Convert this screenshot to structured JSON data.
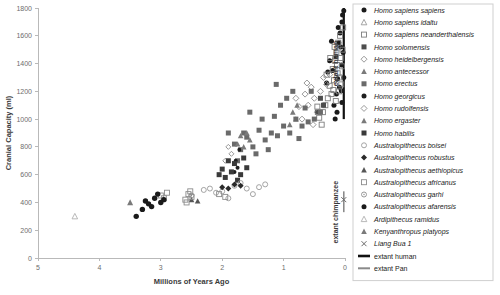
{
  "chart_data": {
    "type": "scatter",
    "title": "",
    "xlabel": "Millions of Years Ago",
    "ylabel": "Cranial Capacity (ml)",
    "xlim": [
      5,
      0
    ],
    "ylim": [
      0,
      1800
    ],
    "x_reversed": true,
    "xticks": [
      5,
      4,
      3,
      2,
      1,
      0
    ],
    "yticks": [
      0,
      200,
      400,
      600,
      800,
      1000,
      1200,
      1400,
      1600,
      1800
    ],
    "grid": false,
    "legend_position": "right",
    "annotations": [
      {
        "name": "extant-human-label",
        "text": "extant human",
        "x": 0.12,
        "y": 1400,
        "rotation": -90
      },
      {
        "name": "extant-chimpanzee-label",
        "text": "extant chimpanzee",
        "x": 0.12,
        "y": 330,
        "rotation": -90
      }
    ],
    "reference_bars": [
      {
        "name": "extant human",
        "x": 0.02,
        "y_min": 1000,
        "y_max": 1800,
        "color": "#111111",
        "width": 2.2
      },
      {
        "name": "extant Pan",
        "x": 0.02,
        "y_min": 330,
        "y_max": 480,
        "color": "#8a8a8a",
        "width": 1.6
      }
    ],
    "series": [
      {
        "name": "Homo sapiens sapiens",
        "marker": "filled-circle",
        "color": "#1a1a1a",
        "points": [
          [
            0.2,
            1350
          ],
          [
            0.15,
            1450
          ],
          [
            0.1,
            1550
          ],
          [
            0.08,
            1620
          ],
          [
            0.05,
            1700
          ],
          [
            0.04,
            1750
          ],
          [
            0.03,
            1480
          ],
          [
            0.06,
            1390
          ],
          [
            0.12,
            1290
          ],
          [
            0.09,
            1230
          ],
          [
            0.07,
            1520
          ],
          [
            0.11,
            1660
          ],
          [
            0.14,
            1180
          ],
          [
            0.18,
            1100
          ],
          [
            0.25,
            1420
          ],
          [
            0.3,
            1260
          ],
          [
            0.02,
            1780
          ],
          [
            0.02,
            1300
          ],
          [
            0.05,
            1120
          ],
          [
            0.16,
            1000
          ],
          [
            0.22,
            1560
          ],
          [
            0.28,
            1340
          ],
          [
            0.13,
            1050
          ],
          [
            0.06,
            1205
          ]
        ]
      },
      {
        "name": "Homo sapiens idaltu",
        "marker": "open-triangle",
        "color": "#9a9a9a",
        "points": [
          [
            0.16,
            1450
          ]
        ]
      },
      {
        "name": "Homo sapiens neanderthalensis",
        "marker": "open-square",
        "color": "#7d7d7d",
        "points": [
          [
            0.04,
            1500
          ],
          [
            0.05,
            1380
          ],
          [
            0.07,
            1440
          ],
          [
            0.09,
            1300
          ],
          [
            0.11,
            1550
          ],
          [
            0.13,
            1390
          ],
          [
            0.06,
            1250
          ],
          [
            0.08,
            1600
          ],
          [
            0.1,
            1200
          ],
          [
            0.14,
            1480
          ],
          [
            0.12,
            1330
          ],
          [
            0.16,
            1420
          ],
          [
            0.18,
            1280
          ],
          [
            0.2,
            1360
          ],
          [
            0.22,
            1180
          ],
          [
            0.25,
            1240
          ],
          [
            0.28,
            1150
          ],
          [
            0.32,
            1100
          ],
          [
            0.36,
            1050
          ],
          [
            0.42,
            1010
          ],
          [
            0.17,
            1520
          ],
          [
            0.03,
            1660
          ],
          [
            0.15,
            1130
          ],
          [
            0.24,
            1440
          ],
          [
            0.3,
            1320
          ],
          [
            0.38,
            960
          ],
          [
            0.45,
            1090
          ],
          [
            0.19,
            1210
          ]
        ]
      },
      {
        "name": "Homo solomensis",
        "marker": "filled-square",
        "color": "#4d4d4d",
        "points": [
          [
            0.35,
            1100
          ],
          [
            0.4,
            1150
          ],
          [
            0.45,
            1050
          ]
        ]
      },
      {
        "name": "Homo heidelbergensis",
        "marker": "open-diamond",
        "color": "#8c8c8c",
        "points": [
          [
            0.3,
            1250
          ],
          [
            0.4,
            1200
          ],
          [
            0.5,
            1150
          ],
          [
            0.6,
            1100
          ],
          [
            0.35,
            1300
          ],
          [
            0.45,
            1050
          ],
          [
            0.55,
            1230
          ],
          [
            0.65,
            1180
          ],
          [
            0.7,
            1000
          ],
          [
            0.25,
            1320
          ],
          [
            0.75,
            1090
          ],
          [
            0.8,
            1150
          ],
          [
            0.52,
            960
          ],
          [
            0.62,
            1260
          ]
        ]
      },
      {
        "name": "Homo antecessor",
        "marker": "filled-triangle",
        "color": "#7a7a7a",
        "points": [
          [
            0.8,
            1000
          ],
          [
            0.85,
            1050
          ],
          [
            0.9,
            960
          ],
          [
            0.78,
            1100
          ]
        ]
      },
      {
        "name": "Homo erectus",
        "marker": "filled-square-gray",
        "color": "#6a6a6a",
        "points": [
          [
            0.4,
            1050
          ],
          [
            0.5,
            1000
          ],
          [
            0.6,
            980
          ],
          [
            0.7,
            950
          ],
          [
            0.8,
            1000
          ],
          [
            0.9,
            900
          ],
          [
            1.0,
            950
          ],
          [
            1.1,
            880
          ],
          [
            1.2,
            900
          ],
          [
            1.3,
            850
          ],
          [
            1.4,
            920
          ],
          [
            1.5,
            800
          ],
          [
            1.6,
            870
          ],
          [
            1.7,
            780
          ],
          [
            1.8,
            820
          ],
          [
            0.95,
            1150
          ],
          [
            1.05,
            1100
          ],
          [
            1.15,
            1020
          ],
          [
            1.25,
            780
          ],
          [
            1.35,
            1000
          ],
          [
            1.45,
            750
          ],
          [
            1.55,
            1050
          ],
          [
            1.65,
            900
          ],
          [
            0.55,
            1200
          ],
          [
            0.65,
            1080
          ],
          [
            0.75,
            860
          ],
          [
            0.85,
            1200
          ],
          [
            1.75,
            700
          ],
          [
            1.9,
            900
          ],
          [
            1.12,
            1250
          ]
        ]
      },
      {
        "name": "Homo georgicus",
        "marker": "filled-circle-sm",
        "color": "#1f1f1f",
        "points": [
          [
            1.75,
            650
          ],
          [
            1.78,
            700
          ],
          [
            1.8,
            620
          ],
          [
            1.72,
            780
          ]
        ]
      },
      {
        "name": "Homo rudolfensis",
        "marker": "open-diamond-sm",
        "color": "#8c8c8c",
        "points": [
          [
            1.85,
            750
          ],
          [
            1.9,
            800
          ],
          [
            1.95,
            700
          ]
        ]
      },
      {
        "name": "Homo ergaster",
        "marker": "filled-triangle-gray",
        "color": "#7a7a7a",
        "points": [
          [
            1.55,
            850
          ],
          [
            1.6,
            900
          ],
          [
            1.65,
            800
          ],
          [
            1.7,
            880
          ],
          [
            1.75,
            820
          ]
        ]
      },
      {
        "name": "Homo habilis",
        "marker": "filled-square-dk",
        "color": "#3a3a3a",
        "points": [
          [
            1.6,
            650
          ],
          [
            1.7,
            600
          ],
          [
            1.8,
            680
          ],
          [
            1.85,
            620
          ],
          [
            1.9,
            700
          ],
          [
            1.95,
            580
          ],
          [
            2.0,
            640
          ],
          [
            1.65,
            720
          ],
          [
            1.75,
            560
          ],
          [
            2.05,
            600
          ]
        ]
      },
      {
        "name": "Australopithecus boisei",
        "marker": "open-circle",
        "color": "#9a9a9a",
        "points": [
          [
            1.4,
            510
          ],
          [
            1.6,
            500
          ],
          [
            1.8,
            520
          ],
          [
            2.0,
            480
          ],
          [
            2.2,
            500
          ],
          [
            1.5,
            460
          ],
          [
            1.7,
            540
          ],
          [
            1.9,
            430
          ],
          [
            2.1,
            470
          ],
          [
            1.3,
            530
          ],
          [
            2.3,
            490
          ]
        ]
      },
      {
        "name": "Australopithecus robustus",
        "marker": "filled-diamond",
        "color": "#2a2a2a",
        "points": [
          [
            1.7,
            520
          ],
          [
            1.8,
            530
          ],
          [
            1.9,
            500
          ],
          [
            2.0,
            510
          ]
        ]
      },
      {
        "name": "Australopithecus aethiopicus",
        "marker": "filled-triangle-dk",
        "color": "#555555",
        "points": [
          [
            2.4,
            410
          ],
          [
            2.5,
            420
          ]
        ]
      },
      {
        "name": "Australopithecus africanus",
        "marker": "open-square-lt",
        "color": "#8c8c8c",
        "points": [
          [
            2.5,
            440
          ],
          [
            2.55,
            460
          ],
          [
            2.6,
            420
          ],
          [
            2.58,
            400
          ],
          [
            2.52,
            480
          ],
          [
            3.0,
            450
          ],
          [
            2.95,
            430
          ],
          [
            2.9,
            470
          ],
          [
            2.05,
            460
          ],
          [
            1.95,
            440
          ]
        ]
      },
      {
        "name": "Australopithecus garhi",
        "marker": "open-circle-dot",
        "color": "#8c8c8c",
        "points": [
          [
            2.5,
            450
          ]
        ]
      },
      {
        "name": "Australopithecus afarensis",
        "marker": "filled-circle-md",
        "color": "#1a1a1a",
        "points": [
          [
            3.0,
            400
          ],
          [
            3.1,
            430
          ],
          [
            3.2,
            390
          ],
          [
            3.05,
            460
          ],
          [
            3.15,
            370
          ],
          [
            3.25,
            410
          ],
          [
            2.95,
            420
          ],
          [
            3.3,
            350
          ],
          [
            3.4,
            300
          ]
        ]
      },
      {
        "name": "Ardipithecus ramidus",
        "marker": "open-triangle-lt",
        "color": "#b0b0b0",
        "points": [
          [
            4.4,
            300
          ]
        ]
      },
      {
        "name": "Kenyanthropus platyops",
        "marker": "filled-triangle-md",
        "color": "#7a7a7a",
        "points": [
          [
            3.5,
            400
          ]
        ]
      },
      {
        "name": "Liang Bua 1",
        "marker": "x-cross",
        "color": "#6a6a6a",
        "points": [
          [
            0.02,
            420
          ]
        ]
      }
    ]
  },
  "legend": {
    "items": [
      {
        "label": "Homo sapiens sapiens",
        "marker": "filled-circle",
        "color": "#1a1a1a",
        "style": "italic"
      },
      {
        "label": "Homo sapiens idaltu",
        "marker": "open-triangle",
        "color": "#9a9a9a",
        "style": "italic"
      },
      {
        "label": "Homo sapiens neanderthalensis",
        "marker": "open-square",
        "color": "#7d7d7d",
        "style": "italic"
      },
      {
        "label": "Homo solomensis",
        "marker": "filled-square",
        "color": "#4d4d4d",
        "style": "italic"
      },
      {
        "label": "Homo heidelbergensis",
        "marker": "open-diamond",
        "color": "#8c8c8c",
        "style": "italic"
      },
      {
        "label": "Homo antecessor",
        "marker": "filled-triangle",
        "color": "#7a7a7a",
        "style": "italic"
      },
      {
        "label": "Homo erectus",
        "marker": "filled-square-gray",
        "color": "#6a6a6a",
        "style": "italic"
      },
      {
        "label": "Homo georgicus",
        "marker": "filled-circle-sm",
        "color": "#1f1f1f",
        "style": "italic"
      },
      {
        "label": "Homo rudolfensis",
        "marker": "open-diamond-sm",
        "color": "#8c8c8c",
        "style": "italic"
      },
      {
        "label": "Homo ergaster",
        "marker": "filled-triangle-gray",
        "color": "#7a7a7a",
        "style": "italic"
      },
      {
        "label": "Homo habilis",
        "marker": "filled-square-dk",
        "color": "#3a3a3a",
        "style": "italic"
      },
      {
        "label": "Australopithecus boisei",
        "marker": "open-circle",
        "color": "#9a9a9a",
        "style": "italic"
      },
      {
        "label": "Australopithecus robustus",
        "marker": "filled-diamond",
        "color": "#2a2a2a",
        "style": "italic"
      },
      {
        "label": "Australopithecus aethiopicus",
        "marker": "filled-triangle-dk",
        "color": "#555555",
        "style": "italic"
      },
      {
        "label": "Australopithecus africanus",
        "marker": "open-square-lt",
        "color": "#8c8c8c",
        "style": "italic"
      },
      {
        "label": "Australopithecus garhi",
        "marker": "open-circle-dot",
        "color": "#8c8c8c",
        "style": "italic"
      },
      {
        "label": "Australopithecus afarensis",
        "marker": "filled-circle-md",
        "color": "#1a1a1a",
        "style": "italic"
      },
      {
        "label": "Ardipithecus ramidus",
        "marker": "open-triangle-lt",
        "color": "#b0b0b0",
        "style": "italic"
      },
      {
        "label": "Kenyanthropus platyops",
        "marker": "filled-triangle-md",
        "color": "#7a7a7a",
        "style": "italic"
      },
      {
        "label": "Liang Bua 1",
        "marker": "x-cross",
        "color": "#6a6a6a",
        "style": "italic"
      },
      {
        "label": "extant human",
        "marker": "thick-line-black",
        "color": "#111111",
        "style": "plain"
      },
      {
        "label": "extant Pan",
        "marker": "thick-line-gray",
        "color": "#8a8a8a",
        "style": "plain"
      }
    ]
  },
  "colors": {
    "axis": "#b9b9b9",
    "tick_text": "#6d6d6d",
    "axis_title": "#3a3a3a",
    "legend_border": "#cfcfcf",
    "background": "#ffffff"
  }
}
